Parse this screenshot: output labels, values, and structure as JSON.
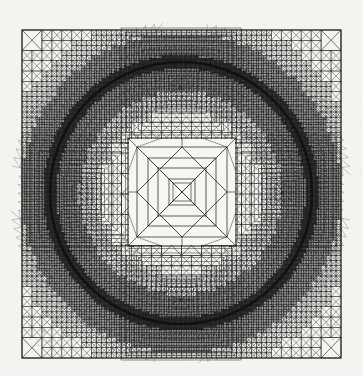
{
  "document": {
    "kind": "scanned-figure",
    "title": "Adaptive finite element mesh on a square domain with circular refinement",
    "background_color": "#f4f3f0",
    "ink_color": "#1c1c1c"
  },
  "figure": {
    "name": "adaptive-triangular-mesh",
    "caption": "",
    "frame": {
      "label": "Square domain boundary",
      "x": 22,
      "y": 30,
      "width": 319,
      "height": 328,
      "stroke_color": "#2a2a2a",
      "stroke_width": 1.2
    },
    "center_square": {
      "label": "Coarse interior square",
      "x": 128,
      "y": 138,
      "width": 108,
      "height": 108,
      "refinement": "coarse"
    },
    "circle": {
      "label": "Interface circle",
      "cx": 181,
      "cy": 193,
      "r": 131,
      "stroke_color": "#111111",
      "stroke_width": 2.6
    },
    "regions": [
      {
        "name": "outer-corner-coarse",
        "refinement_level": 1,
        "description": "Coarse criss-cross quadrilateral cells split into four triangles"
      },
      {
        "name": "graded-transition",
        "refinement_level": 3,
        "description": "Graded band of progressively halved triangles"
      },
      {
        "name": "refined-lobe-ring",
        "refinement_level": 6,
        "description": "Dense concentric square rings of highly refined triangles"
      },
      {
        "name": "interface-band",
        "refinement_level": 7,
        "description": "Maximum refinement hugging the circular interface"
      },
      {
        "name": "inner-coarse-square",
        "refinement_level": 1,
        "description": "Coarse nested squares with diagonal crosses"
      }
    ]
  },
  "chart_data": {
    "type": "diagram",
    "title": "Adaptive triangular finite element mesh",
    "xlabel": "",
    "ylabel": "",
    "xlim": [
      0,
      1
    ],
    "ylim": [
      0,
      1
    ],
    "grid": false,
    "legend": "none",
    "annotations": [],
    "mesh": {
      "element_type": "triangle",
      "domain": "unit square",
      "interface": "circle",
      "interface_radius_fraction": 0.41,
      "inner_square_half_width_fraction": 0.17,
      "max_refinement_levels": 7,
      "symmetry": "4-fold (dihedral D4)"
    }
  }
}
